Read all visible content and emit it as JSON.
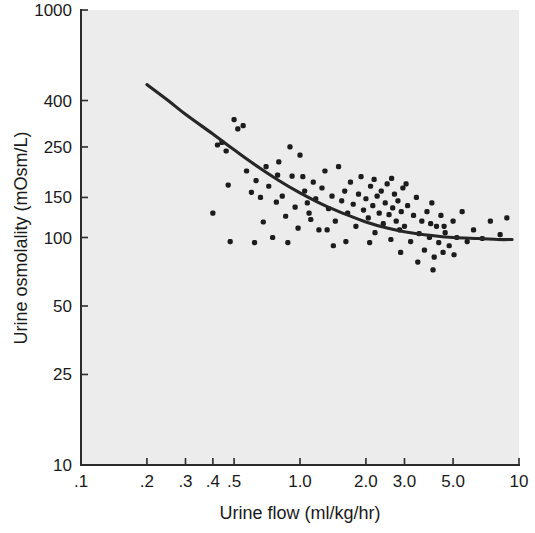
{
  "chart_data": {
    "type": "scatter",
    "title": "",
    "xlabel": "Urine flow (ml/kg/hr)",
    "ylabel": "Urine osmolality (mOsm/L)",
    "xscale": "log",
    "yscale": "log",
    "xlim": [
      0.1,
      10
    ],
    "ylim": [
      10,
      1000
    ],
    "grid": false,
    "legend": null,
    "xticks": [
      0.1,
      0.2,
      0.3,
      0.4,
      0.5,
      1.0,
      2.0,
      3.0,
      5.0,
      10
    ],
    "xticklabels": [
      ".1",
      ".2",
      ".3",
      ".4",
      ".5",
      "1.0",
      "2.0",
      "3.0",
      "5.0",
      "10"
    ],
    "yticks": [
      10,
      25,
      50,
      100,
      150,
      250,
      400,
      1000
    ],
    "yticklabels": [
      "10",
      "25",
      "50",
      "100",
      "150",
      "250",
      "400",
      "1000"
    ],
    "points": [
      [
        0.4,
        128
      ],
      [
        0.42,
        255
      ],
      [
        0.44,
        262
      ],
      [
        0.46,
        240
      ],
      [
        0.47,
        170
      ],
      [
        0.5,
        330
      ],
      [
        0.52,
        300
      ],
      [
        0.55,
        310
      ],
      [
        0.57,
        196
      ],
      [
        0.6,
        158
      ],
      [
        0.63,
        178
      ],
      [
        0.66,
        150
      ],
      [
        0.68,
        117
      ],
      [
        0.7,
        205
      ],
      [
        0.72,
        168
      ],
      [
        0.75,
        100
      ],
      [
        0.78,
        143
      ],
      [
        0.8,
        215
      ],
      [
        0.83,
        152
      ],
      [
        0.86,
        124
      ],
      [
        0.88,
        95
      ],
      [
        0.92,
        186
      ],
      [
        0.95,
        136
      ],
      [
        0.98,
        110
      ],
      [
        1.0,
        230
      ],
      [
        1.05,
        160
      ],
      [
        1.08,
        142
      ],
      [
        1.12,
        120
      ],
      [
        1.15,
        175
      ],
      [
        1.18,
        148
      ],
      [
        1.22,
        108
      ],
      [
        1.26,
        165
      ],
      [
        1.3,
        196
      ],
      [
        1.35,
        134
      ],
      [
        1.4,
        152
      ],
      [
        1.45,
        118
      ],
      [
        1.5,
        205
      ],
      [
        1.55,
        145
      ],
      [
        1.6,
        160
      ],
      [
        1.65,
        128
      ],
      [
        1.7,
        175
      ],
      [
        1.75,
        140
      ],
      [
        1.8,
        112
      ],
      [
        1.85,
        155
      ],
      [
        1.9,
        185
      ],
      [
        1.95,
        132
      ],
      [
        2.0,
        148
      ],
      [
        2.05,
        122
      ],
      [
        2.1,
        168
      ],
      [
        2.15,
        138
      ],
      [
        2.2,
        105
      ],
      [
        2.25,
        152
      ],
      [
        2.3,
        128
      ],
      [
        2.35,
        160
      ],
      [
        2.4,
        115
      ],
      [
        2.45,
        142
      ],
      [
        2.5,
        172
      ],
      [
        2.55,
        126
      ],
      [
        2.6,
        98
      ],
      [
        2.65,
        135
      ],
      [
        2.7,
        155
      ],
      [
        2.75,
        118
      ],
      [
        2.8,
        145
      ],
      [
        2.85,
        108
      ],
      [
        2.9,
        130
      ],
      [
        2.95,
        165
      ],
      [
        3.0,
        112
      ],
      [
        3.1,
        138
      ],
      [
        3.2,
        96
      ],
      [
        3.3,
        125
      ],
      [
        3.4,
        150
      ],
      [
        3.5,
        104
      ],
      [
        3.6,
        118
      ],
      [
        3.7,
        88
      ],
      [
        3.8,
        130
      ],
      [
        3.9,
        100
      ],
      [
        4.0,
        142
      ],
      [
        4.1,
        82
      ],
      [
        4.2,
        112
      ],
      [
        4.3,
        95
      ],
      [
        4.4,
        125
      ],
      [
        4.5,
        86
      ],
      [
        4.6,
        105
      ],
      [
        4.8,
        92
      ],
      [
        5.0,
        118
      ],
      [
        5.2,
        100
      ],
      [
        5.5,
        130
      ],
      [
        5.8,
        96
      ],
      [
        6.2,
        108
      ],
      [
        6.8,
        99
      ],
      [
        7.4,
        118
      ],
      [
        8.2,
        103
      ],
      [
        8.8,
        122
      ],
      [
        1.03,
        185
      ],
      [
        1.33,
        108
      ],
      [
        2.08,
        95
      ],
      [
        2.62,
        182
      ],
      [
        3.05,
        172
      ],
      [
        0.9,
        250
      ],
      [
        1.62,
        96
      ],
      [
        3.45,
        78
      ],
      [
        4.05,
        72
      ],
      [
        0.48,
        96
      ],
      [
        0.62,
        95
      ],
      [
        1.42,
        92
      ],
      [
        2.18,
        180
      ],
      [
        2.88,
        86
      ],
      [
        3.95,
        115
      ],
      [
        4.55,
        112
      ],
      [
        5.05,
        84
      ],
      [
        0.79,
        188
      ],
      [
        1.1,
        128
      ]
    ],
    "fit_curve": {
      "description": "fitted decay curve",
      "points": [
        [
          0.2,
          470
        ],
        [
          0.25,
          400
        ],
        [
          0.3,
          348
        ],
        [
          0.4,
          285
        ],
        [
          0.5,
          243
        ],
        [
          0.6,
          214
        ],
        [
          0.8,
          178
        ],
        [
          1.0,
          157
        ],
        [
          1.3,
          138
        ],
        [
          1.6,
          127
        ],
        [
          2.0,
          117
        ],
        [
          2.5,
          110
        ],
        [
          3.0,
          106
        ],
        [
          4.0,
          102
        ],
        [
          5.0,
          100
        ],
        [
          6.5,
          99
        ],
        [
          8.0,
          98
        ],
        [
          9.3,
          98
        ]
      ]
    }
  }
}
